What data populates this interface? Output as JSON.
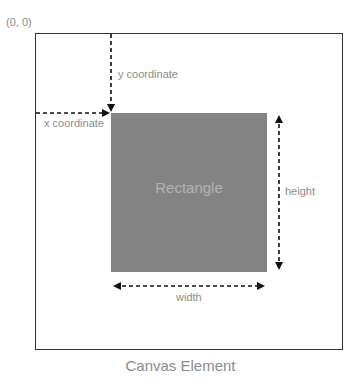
{
  "diagram": {
    "origin_label": "(0, 0)",
    "y_label": "y coordinate",
    "x_label": "x coordinate",
    "rect_label": "Rectangle",
    "height_label": "height",
    "width_label": "width",
    "caption": "Canvas Element",
    "colors": {
      "border": "#333333",
      "rect_fill": "#838383",
      "text": "#8a8a8a"
    }
  }
}
